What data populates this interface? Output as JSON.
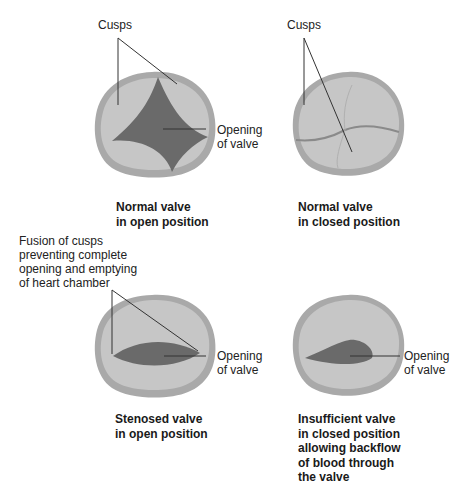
{
  "panels": [
    {
      "id": "normal-open",
      "caption": [
        "Normal valve",
        "in open position"
      ],
      "labels": {
        "cusps": "Cusps",
        "opening": [
          "Opening",
          "of valve"
        ]
      }
    },
    {
      "id": "normal-closed",
      "caption": [
        "Normal valve",
        "in closed position"
      ],
      "labels": {
        "cusps": "Cusps"
      }
    },
    {
      "id": "stenosed-open",
      "caption": [
        "Stenosed valve",
        "in open position"
      ],
      "labels": {
        "fusion": [
          "Fusion of cusps",
          "preventing complete",
          "opening and emptying",
          "of heart chamber"
        ],
        "opening": [
          "Opening",
          "of valve"
        ]
      }
    },
    {
      "id": "insufficient-closed",
      "caption": [
        "Insufficient valve",
        "in closed position",
        "allowing backflow",
        "of blood through",
        "the valve"
      ],
      "labels": {
        "opening": [
          "Opening",
          "of valve"
        ]
      }
    }
  ],
  "colors": {
    "ring": "#a9a9a9",
    "cusp": "#c4c4c4",
    "opening": "#6a6a6a",
    "line": "#333333"
  }
}
